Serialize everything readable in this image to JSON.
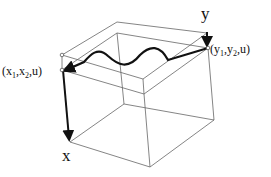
{
  "diagram": {
    "labels": {
      "y_axis": "y",
      "x_axis": "x",
      "start_point": {
        "prefix": "(x",
        "sub1": "1",
        "mid": ",x",
        "sub2": "2",
        "suffix": ",u)"
      },
      "end_point": {
        "prefix": "(y",
        "sub1": "1",
        "mid": ",y",
        "sub2": "2",
        "suffix": ",u)"
      }
    },
    "colors": {
      "edges": "#555555",
      "curve": "#111111",
      "background": "#ffffff"
    }
  }
}
